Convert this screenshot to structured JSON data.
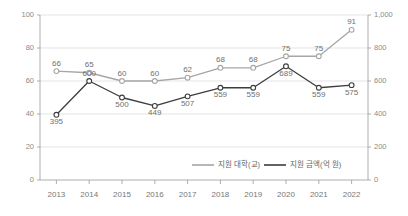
{
  "chart_data": {
    "type": "line",
    "title": "",
    "subtitle": "",
    "xlabel": "",
    "ylabel": "",
    "grid": true,
    "legend_position": "bottom-center",
    "categories": [
      "2013",
      "2014",
      "2015",
      "2016",
      "2017",
      "2018",
      "2019",
      "2020",
      "2021",
      "2022"
    ],
    "axes": {
      "left": {
        "label": "",
        "ylim": [
          0,
          100
        ],
        "ticks": [
          0,
          20,
          40,
          60,
          80,
          100
        ],
        "tick_labels": [
          "0",
          "20",
          "40",
          "60",
          "80",
          "100"
        ]
      },
      "right": {
        "label": "",
        "ylim": [
          0,
          1000
        ],
        "ticks": [
          0,
          200,
          400,
          600,
          800,
          1000
        ],
        "tick_labels": [
          "0",
          "200",
          "400",
          "600",
          "800",
          "1,000"
        ]
      }
    },
    "series": [
      {
        "name": "지원 대학(교)",
        "axis": "left",
        "color": "#a6a6a6",
        "marker": "circle",
        "values": [
          66,
          65,
          60,
          60,
          62,
          68,
          68,
          75,
          75,
          91
        ],
        "data_labels": [
          "66",
          "65",
          "60",
          "60",
          "62",
          "68",
          "68",
          "75",
          "75",
          "91"
        ]
      },
      {
        "name": "지원 금액(억 원)",
        "axis": "right",
        "color": "#3d3d3d",
        "marker": "circle",
        "values": [
          395,
          600,
          500,
          449,
          507,
          559,
          559,
          689,
          559,
          575
        ],
        "data_labels": [
          "395",
          "600",
          "500",
          "449",
          "507",
          "559",
          "559",
          "689",
          "559",
          "575"
        ]
      }
    ],
    "legend": [
      {
        "label": "지원 대학(교)",
        "color": "#a6a6a6"
      },
      {
        "label": "지원 금액(억 원)",
        "color": "#3d3d3d"
      }
    ]
  }
}
